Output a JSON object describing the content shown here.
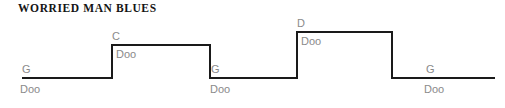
{
  "title": "WORRIED MAN BLUES",
  "colors": {
    "line": "#1a1a1a",
    "label": "#8a8a8a",
    "title": "#141414",
    "background": "#ffffff"
  },
  "chart_data": {
    "type": "line",
    "title": "WORRIED MAN BLUES",
    "xlabel": "",
    "ylabel": "",
    "grid": false,
    "legend": null,
    "xlim": [
      22,
      495
    ],
    "ylim": [
      32,
      78
    ],
    "levels": {
      "G": 78,
      "C": 45,
      "D": 32
    },
    "segments": [
      {
        "chord": "G",
        "lyric": "Doo",
        "x_start": 22,
        "x_end": 112,
        "y": 78
      },
      {
        "chord": "C",
        "lyric": "Doo",
        "x_start": 112,
        "x_end": 210,
        "y": 45
      },
      {
        "chord": "G",
        "lyric": "Doo",
        "x_start": 210,
        "x_end": 297,
        "y": 78
      },
      {
        "chord": "D",
        "lyric": "Doo",
        "x_start": 297,
        "x_end": 392,
        "y": 32
      },
      {
        "chord": "G",
        "lyric": "Doo",
        "x_start": 392,
        "x_end": 495,
        "y": 78
      }
    ],
    "chord_sequence": [
      "G",
      "C",
      "G",
      "D",
      "G"
    ],
    "lyric_sequence": [
      "Doo",
      "Doo",
      "Doo",
      "Doo",
      "Doo"
    ],
    "polyline_points": "22,78 112,78 112,45 210,45 210,78 297,78 297,32 392,32 392,78 495,78"
  },
  "labels": {
    "chords": [
      {
        "text": "G",
        "x": 22,
        "y": 64
      },
      {
        "text": "C",
        "x": 112,
        "y": 31
      },
      {
        "text": "G",
        "x": 211,
        "y": 64
      },
      {
        "text": "D",
        "x": 297,
        "y": 18
      },
      {
        "text": "G",
        "x": 426,
        "y": 64
      }
    ],
    "lyrics": [
      {
        "text": "Doo",
        "x": 20,
        "y": 84
      },
      {
        "text": "Doo",
        "x": 116,
        "y": 49
      },
      {
        "text": "Doo",
        "x": 210,
        "y": 84
      },
      {
        "text": "Doo",
        "x": 301,
        "y": 36
      },
      {
        "text": "Doo",
        "x": 424,
        "y": 84
      }
    ]
  }
}
